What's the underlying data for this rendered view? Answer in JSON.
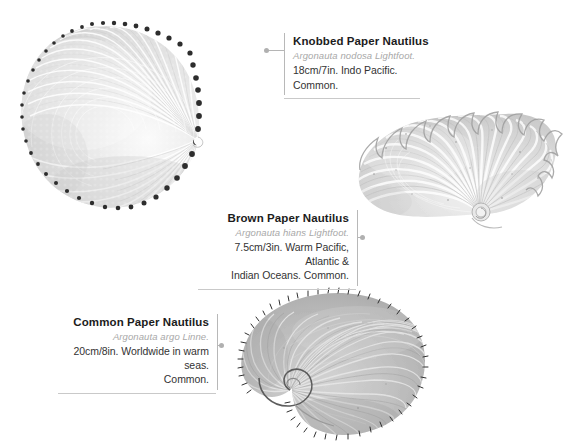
{
  "plate": {
    "background_color": "#ffffff",
    "rule_color": "#c9c9c9",
    "leader_color": "#b5b5b5"
  },
  "specimens": [
    {
      "id": "knobbed-paper-nautilus",
      "common_name": "Knobbed Paper Nautilus",
      "species": "Argonauta nodosa Lightfoot.",
      "description_line1": "18cm/7in. Indo Pacific.",
      "description_line2": "Common.",
      "align": "left",
      "shell_tone": "#e6e6e6"
    },
    {
      "id": "brown-paper-nautilus",
      "common_name": "Brown Paper Nautilus",
      "species": "Argonauta hians Lightfoot.",
      "description_line1": "7.5cm/3in. Warm Pacific, Atlantic &",
      "description_line2": "Indian Oceans. Common.",
      "align": "right",
      "shell_tone": "#d9d9d9"
    },
    {
      "id": "common-paper-nautilus",
      "common_name": "Common Paper Nautilus",
      "species": "Argonauta argo Linne.",
      "description_line1": "20cm/8in. Worldwide in warm seas.",
      "description_line2": "Common.",
      "align": "right",
      "shell_tone": "#b9b9b9"
    }
  ]
}
